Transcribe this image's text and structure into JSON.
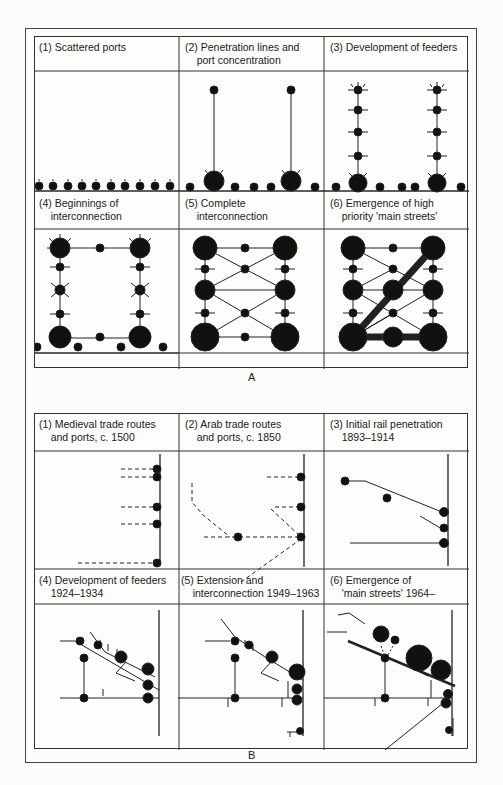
{
  "figure": {
    "panels": [
      {
        "letter": "A",
        "cells": [
          {
            "label_line1": "(1) Scattered ports",
            "label_line2": ""
          },
          {
            "label_line1": "(2) Penetration lines and",
            "label_line2": "port concentration"
          },
          {
            "label_line1": "(3) Development of feeders",
            "label_line2": ""
          },
          {
            "label_line1": "(4) Beginnings of",
            "label_line2": "interconnection"
          },
          {
            "label_line1": "(5) Complete",
            "label_line2": "interconnection"
          },
          {
            "label_line1": "(6) Emergence of high",
            "label_line2": "priority 'main streets'"
          }
        ]
      },
      {
        "letter": "B",
        "cells": [
          {
            "label_line1": "(1) Medieval trade routes",
            "label_line2": "and ports, c. 1500"
          },
          {
            "label_line1": "(2) Arab trade routes",
            "label_line2": "and ports, c. 1850"
          },
          {
            "label_line1": "(3) Initial rail penetration",
            "label_line2": "1893–1914"
          },
          {
            "label_line1": "(4) Development of feeders",
            "label_line2": "1924–1934"
          },
          {
            "label_line1": "(5) Extension and",
            "label_line2": "interconnection 1949–1963"
          },
          {
            "label_line1": "(6) Emergence of",
            "label_line2": "'main streets' 1964–"
          }
        ]
      }
    ],
    "colors": {
      "ink": "#111111",
      "border": "#333333",
      "background": "#fbfbfa"
    }
  }
}
